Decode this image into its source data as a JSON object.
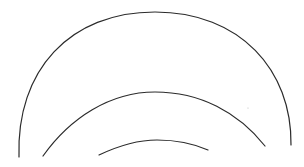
{
  "diagram": {
    "background": "#ffffff",
    "stroke_color": "#2b2b2b",
    "arcs": [
      {
        "name": "outer-arc",
        "path": "M19,157 C16,70 70,12 155,12 C240,12 292,70 291,145",
        "stroke_width": 1.2
      },
      {
        "name": "middle-arc",
        "path": "M43,156 C70,118 110,92 155,92 C200,92 238,112 265,146",
        "stroke_width": 1.2
      },
      {
        "name": "inner-arc",
        "path": "M99,155 C118,146 136,140 157,140 C175,140 192,143 208,150",
        "stroke_width": 1.2
      }
    ],
    "speck": {
      "cx": 248,
      "cy": 108,
      "r": 0.6,
      "color": "#bbbbbb"
    }
  }
}
